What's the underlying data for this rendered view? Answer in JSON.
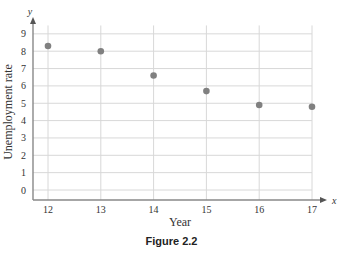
{
  "chart_data": {
    "type": "scatter",
    "title": "",
    "xlabel": "Year",
    "ylabel": "Unemployment rate",
    "x_axis_variable": "x",
    "y_axis_variable": "y",
    "x": [
      12,
      13,
      14,
      15,
      16,
      17
    ],
    "values": [
      8.3,
      8.0,
      6.6,
      5.7,
      4.9,
      4.8
    ],
    "x_ticks": [
      12,
      13,
      14,
      15,
      16,
      17
    ],
    "y_ticks": [
      0,
      1,
      2,
      3,
      4,
      5,
      6,
      7,
      8,
      9
    ],
    "xlim": [
      11.7,
      17.4
    ],
    "ylim": [
      -0.6,
      9.6
    ],
    "grid": true,
    "legend": null,
    "colors": {
      "point": "#808080",
      "grid": "#d8d8d8",
      "axis": "#888888"
    }
  },
  "caption": "Figure 2.2"
}
